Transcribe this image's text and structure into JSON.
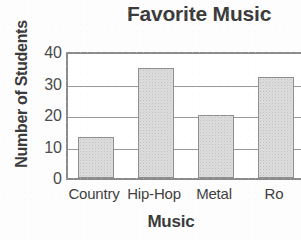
{
  "chart_data": {
    "type": "bar",
    "title": "Favorite Music",
    "xlabel": "Music",
    "ylabel": "Number of Students",
    "categories": [
      "Country",
      "Hip-Hop",
      "Metal",
      "Rock"
    ],
    "values": [
      13,
      35,
      20,
      32
    ],
    "series": [
      {
        "name": "Number of Students",
        "values": [
          13,
          35,
          20,
          32
        ]
      }
    ],
    "ylim": [
      0,
      40
    ],
    "yticks": [
      0,
      10,
      20,
      30,
      40
    ],
    "ytick_labels": [
      "0",
      "10",
      "20",
      "30",
      "40"
    ],
    "grid": "horizontal",
    "legend": "none",
    "visible_category_labels": [
      "Country",
      "Hip-Hop",
      "Metal",
      "Ro"
    ],
    "colors": {
      "bar_fill": "#dcdcdc",
      "bar_border": "#8f8f8f",
      "axis": "#8a8a8a",
      "gridline": "#9a9a9a",
      "title_text": "#3b3b3b",
      "tick_text": "#4a4a4a",
      "background": "#fdfdfd"
    }
  }
}
